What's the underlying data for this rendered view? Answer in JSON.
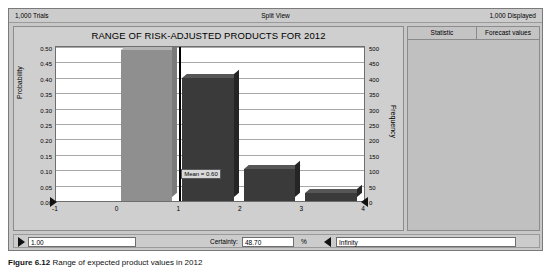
{
  "topbar": {
    "trials": "1,000 Trials",
    "view_mode": "Split View",
    "displayed": "1,000 Displayed"
  },
  "chart_data": {
    "type": "bar",
    "title": "RANGE OF RISK-ADJUSTED PRODUCTS FOR 2012",
    "xlabel": "",
    "ylabel": "Probability",
    "y2label": "Frequency",
    "categories": [
      "0",
      "1",
      "2",
      "3"
    ],
    "values": [
      0.49,
      0.4,
      0.105,
      0.025
    ],
    "frequencies": [
      490,
      400,
      105,
      25
    ],
    "ylim": [
      0.0,
      0.5
    ],
    "y2lim": [
      0,
      500
    ],
    "xlim": [
      -1,
      4
    ],
    "xticks": [
      "-1",
      "0",
      "1",
      "2",
      "3",
      "4"
    ],
    "yticks": [
      "0.50",
      "0.45",
      "0.40",
      "0.35",
      "0.30",
      "0.25",
      "0.20",
      "0.15",
      "0.10",
      "0.05",
      "0.00"
    ],
    "y2ticks": [
      "500",
      "450",
      "400",
      "350",
      "300",
      "250",
      "200",
      "150",
      "100",
      "50",
      "0"
    ],
    "grid": true,
    "legend": "none",
    "annotation": "Mean = 0.60",
    "bar_colors": [
      "#8f8f8f",
      "#3a3a3a",
      "#3a3a3a",
      "#3a3a3a"
    ]
  },
  "stats": {
    "header": {
      "statistic": "Statistic",
      "values": "Forecast values"
    },
    "rows": [
      {
        "label": "Trials",
        "value": "1,000"
      },
      {
        "label": "Base Case",
        "value": "0.60"
      },
      {
        "label": "Mean",
        "value": "0.60"
      },
      {
        "label": "Median",
        "value": "0.00"
      },
      {
        "label": "Mode",
        "value": "0.00"
      },
      {
        "label": "Standard Deviation",
        "value": "0.69"
      },
      {
        "label": "Variance",
        "value": "0.48"
      },
      {
        "label": "Skewness",
        "value": "0.0695"
      },
      {
        "label": "Kurtosis",
        "value": "3.07"
      },
      {
        "label": "Coeff. of Variability",
        "value": "1.16"
      },
      {
        "label": "Minimum",
        "value": "0.00"
      },
      {
        "label": "Maximum",
        "value": "3.00"
      },
      {
        "label": "Mean Std. Error",
        "value": "0.02"
      }
    ]
  },
  "bottombar": {
    "lower_bound": "1.00",
    "certainty_label": "Certainty:",
    "certainty_value": "48.70",
    "percent_symbol": "%",
    "upper_bound": "Infinity"
  },
  "caption": {
    "figure_number": "Figure 6.12",
    "text": "Range of expected product values in 2012"
  },
  "icons": {
    "spin_right": "spin-right-arrow",
    "spin_left": "spin-left-arrow",
    "grabber_left": "axis-grabber-left",
    "grabber_right": "axis-grabber-right"
  }
}
